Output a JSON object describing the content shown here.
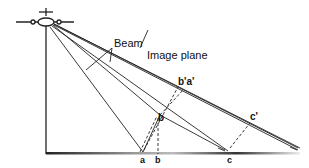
{
  "diagram": {
    "labels": {
      "beam": "Beam",
      "image_plane": "Image plane",
      "a": "a",
      "b_ground": "b",
      "b_elevated": "b",
      "c": "c",
      "b_prime_a_prime": "b'a'",
      "c_prime": "c'"
    },
    "colors": {
      "line": "#222222",
      "ground": "#333333",
      "background": "#ffffff"
    }
  }
}
